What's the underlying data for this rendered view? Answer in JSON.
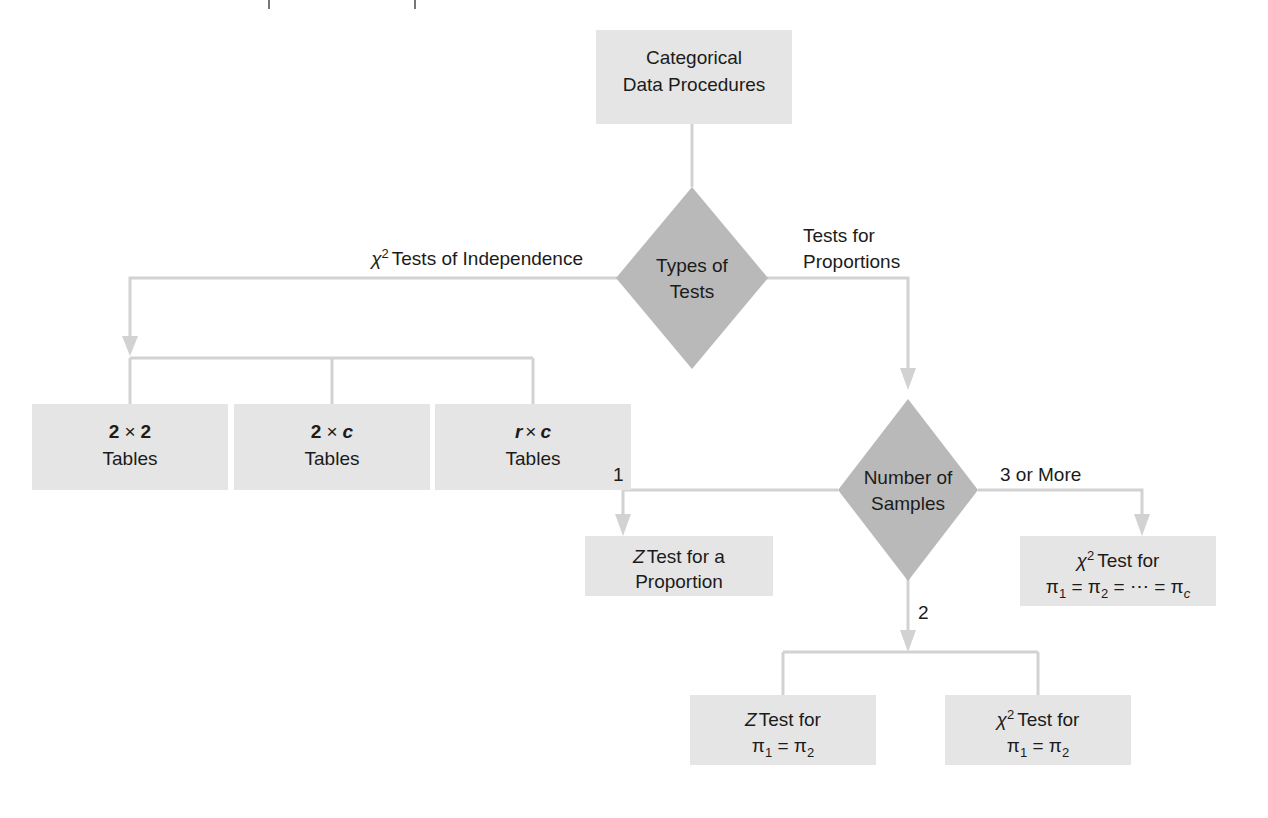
{
  "diagram": {
    "title": "Categorical Data Procedures",
    "colors": {
      "box_fill": "#e5e5e5",
      "diamond_fill": "#b9b9b9",
      "connector": "#d2d2d2",
      "text": "#1b1b1b",
      "background": "#ffffff"
    },
    "nodes": {
      "root": {
        "shape": "box",
        "line1": "Categorical",
        "line2": "Data Procedures"
      },
      "types_of_tests": {
        "shape": "diamond",
        "line1": "Types of",
        "line2": "Tests"
      },
      "table_2x2": {
        "shape": "box",
        "line1_a": "2",
        "line1_op": "×",
        "line1_b": "2",
        "line2": "Tables"
      },
      "table_2xc": {
        "shape": "box",
        "line1_a": "2",
        "line1_op": "×",
        "line1_b": "c",
        "line2": "Tables"
      },
      "table_rxc": {
        "shape": "box",
        "line1_a": "r",
        "line1_op": "×",
        "line1_b": "c",
        "line2": "Tables"
      },
      "number_of_samples": {
        "shape": "diamond",
        "line1": "Number of",
        "line2": "Samples"
      },
      "z_test_proportion": {
        "shape": "box",
        "line1_a": "Z",
        "line1_b": "Test for a",
        "line2": "Proportion"
      },
      "chi_test_multi": {
        "shape": "box",
        "line1_a": "χ",
        "line1_sup": "2",
        "line1_b": "Test for",
        "line2_p1": "π",
        "line2_s1": "1",
        "line2_eq1": " = ",
        "line2_p2": "π",
        "line2_s2": "2",
        "line2_eq2": " = ",
        "line2_dots": "⋯",
        "line2_eq3": " = ",
        "line2_p3": "π",
        "line2_s3": "c"
      },
      "z_test_two": {
        "shape": "box",
        "line1_a": "Z",
        "line1_b": "Test for",
        "line2_p1": "π",
        "line2_s1": "1",
        "line2_eq1": " = ",
        "line2_p2": "π",
        "line2_s2": "2"
      },
      "chi_test_two": {
        "shape": "box",
        "line1_a": "χ",
        "line1_sup": "2",
        "line1_b": "Test for",
        "line2_p1": "π",
        "line2_s1": "1",
        "line2_eq1": " = ",
        "line2_p2": "π",
        "line2_s2": "2"
      }
    },
    "edge_labels": {
      "chi_independence_a": "χ",
      "chi_independence_sup": "2",
      "chi_independence_b": "Tests of Independence",
      "tests_for_proportions_l1": "Tests for",
      "tests_for_proportions_l2": "Proportions",
      "samples_one": "1",
      "samples_two": "2",
      "samples_three_or_more": "3 or More"
    }
  }
}
